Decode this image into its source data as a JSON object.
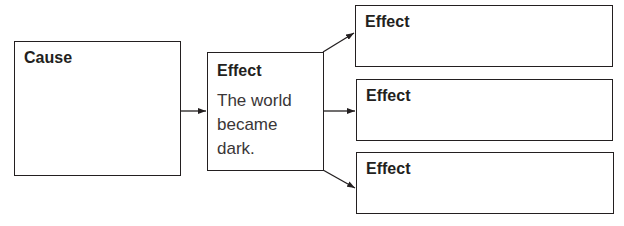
{
  "diagram": {
    "type": "cause-effect graphic organizer",
    "cause": {
      "title": "Cause",
      "text": ""
    },
    "effect_main": {
      "title": "Effect",
      "text": "The world became dark.",
      "lines": [
        "The world",
        "became",
        "dark."
      ]
    },
    "effects": [
      {
        "title": "Effect",
        "text": ""
      },
      {
        "title": "Effect",
        "text": ""
      },
      {
        "title": "Effect",
        "text": ""
      }
    ],
    "colors": {
      "stroke": "#231f20",
      "background": "#ffffff"
    }
  }
}
